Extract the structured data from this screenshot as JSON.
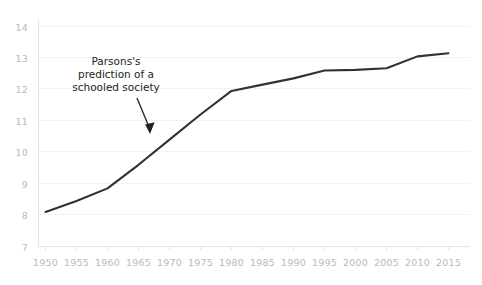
{
  "chart_data": {
    "type": "line",
    "title": "",
    "subtitle": "",
    "xlabel": "",
    "ylabel": "",
    "x": [
      1950,
      1955,
      1960,
      1965,
      1970,
      1975,
      1980,
      1985,
      1990,
      1995,
      2000,
      2005,
      2010,
      2015
    ],
    "categories": [
      "1950",
      "1955",
      "1960",
      "1965",
      "1970",
      "1975",
      "1980",
      "1985",
      "1990",
      "1995",
      "2000",
      "2005",
      "2010",
      "2015"
    ],
    "values": [
      8.1,
      8.45,
      8.85,
      9.6,
      10.4,
      11.2,
      11.95,
      12.15,
      12.35,
      12.6,
      12.62,
      12.67,
      13.05,
      13.15
    ],
    "series": [
      {
        "name": "years of schooling",
        "values": [
          8.1,
          8.45,
          8.85,
          9.6,
          10.4,
          11.2,
          11.95,
          12.15,
          12.35,
          12.6,
          12.62,
          12.67,
          13.05,
          13.15
        ],
        "color": "#333134"
      }
    ],
    "xlim": [
      1950,
      2015
    ],
    "ylim": [
      7,
      14
    ],
    "xticks": [
      "1950",
      "1955",
      "1960",
      "1965",
      "1970",
      "1975",
      "1980",
      "1985",
      "1990",
      "1995",
      "2000",
      "2005",
      "2010",
      "2015"
    ],
    "yticks": [
      "7",
      "8",
      "9",
      "10",
      "11",
      "12",
      "13",
      "14"
    ],
    "grid": true,
    "legend": "none",
    "annotations": [
      {
        "text": "Parsons's\nprediction of a\nschooled society",
        "target_x": 1967,
        "target_y": 10.05,
        "arrow": true
      }
    ]
  },
  "colors": {
    "line": "#333134",
    "axis": "#e6e6e8",
    "grid": "#f0f0f1",
    "tick_text": "#b9b9bd",
    "annotation_text": "#231f20",
    "background": "#ffffff"
  }
}
